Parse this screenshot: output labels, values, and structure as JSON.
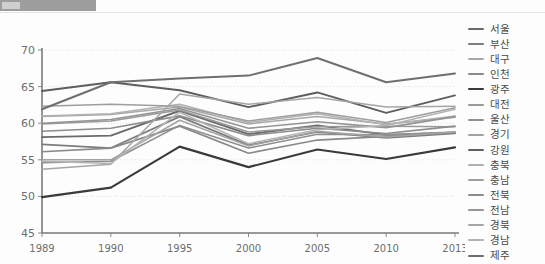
{
  "topbar": {
    "present": true
  },
  "chart_data": {
    "type": "line",
    "title": "",
    "xlabel": "",
    "ylabel": "",
    "x": [
      "1989",
      "1990",
      "1995",
      "2000",
      "2005",
      "2010",
      "2013"
    ],
    "ylim": [
      45,
      70
    ],
    "yticks": [
      45,
      50,
      55,
      60,
      65,
      70
    ],
    "grid": true,
    "legend_position": "right",
    "series": [
      {
        "name": "서울",
        "color": "#6b6b6b",
        "width": 1.9,
        "values": [
          58.1,
          58.3,
          61.7,
          58.5,
          59.7,
          58.4,
          58.7
        ]
      },
      {
        "name": "부산",
        "color": "#7d7d7d",
        "width": 1.7,
        "values": [
          57.1,
          56.6,
          60.9,
          57.0,
          58.8,
          58.0,
          58.6
        ]
      },
      {
        "name": "대구",
        "color": "#a8a8a8",
        "width": 1.5,
        "values": [
          60.9,
          61.2,
          62.2,
          59.9,
          60.9,
          59.9,
          60.8
        ]
      },
      {
        "name": "인천",
        "color": "#8a8a8a",
        "width": 1.7,
        "values": [
          56.1,
          56.6,
          59.6,
          55.9,
          57.7,
          58.2,
          58.7
        ]
      },
      {
        "name": "광주",
        "color": "#3a3a3a",
        "width": 2.1,
        "values": [
          49.9,
          51.2,
          56.8,
          54.0,
          56.4,
          55.1,
          56.7
        ]
      },
      {
        "name": "대전",
        "color": "#9a9a9a",
        "width": 1.5,
        "values": [
          59.9,
          60.3,
          61.8,
          58.8,
          59.5,
          59.6,
          59.5
        ]
      },
      {
        "name": "울산",
        "color": "#8f8f8f",
        "width": 1.6,
        "values": [
          54.6,
          54.8,
          59.7,
          56.6,
          58.5,
          58.4,
          58.8
        ]
      },
      {
        "name": "경기",
        "color": "#a2a2a2",
        "width": 1.5,
        "values": [
          55.0,
          55.0,
          60.4,
          56.9,
          58.9,
          58.1,
          58.8
        ]
      },
      {
        "name": "강원",
        "color": "#5e5e5e",
        "width": 1.9,
        "values": [
          64.4,
          65.6,
          64.5,
          62.2,
          64.2,
          61.4,
          63.8
        ]
      },
      {
        "name": "충북",
        "color": "#b0b0b0",
        "width": 1.5,
        "values": [
          61.0,
          61.3,
          62.6,
          60.1,
          61.3,
          59.8,
          61.0
        ]
      },
      {
        "name": "충남",
        "color": "#9e9e9e",
        "width": 1.5,
        "values": [
          62.3,
          62.6,
          62.3,
          60.3,
          61.5,
          60.1,
          62.1
        ]
      },
      {
        "name": "전북",
        "color": "#8c8c8c",
        "width": 1.6,
        "values": [
          58.9,
          59.3,
          61.0,
          58.3,
          59.3,
          58.6,
          59.6
        ]
      },
      {
        "name": "전남",
        "color": "#949494",
        "width": 1.6,
        "values": [
          60.0,
          60.5,
          62.0,
          59.3,
          60.2,
          59.4,
          60.9
        ]
      },
      {
        "name": "경북",
        "color": "#a6a6a6",
        "width": 1.5,
        "values": [
          53.7,
          54.4,
          64.0,
          62.6,
          63.5,
          62.2,
          62.3
        ]
      },
      {
        "name": "경남",
        "color": "#b4b4b4",
        "width": 1.5,
        "values": [
          54.8,
          54.5,
          61.5,
          57.2,
          59.1,
          59.7,
          61.9
        ]
      },
      {
        "name": "제주",
        "color": "#6f6f6f",
        "width": 2.0,
        "values": [
          61.9,
          65.6,
          66.1,
          66.5,
          68.9,
          65.6,
          66.8
        ]
      }
    ]
  }
}
